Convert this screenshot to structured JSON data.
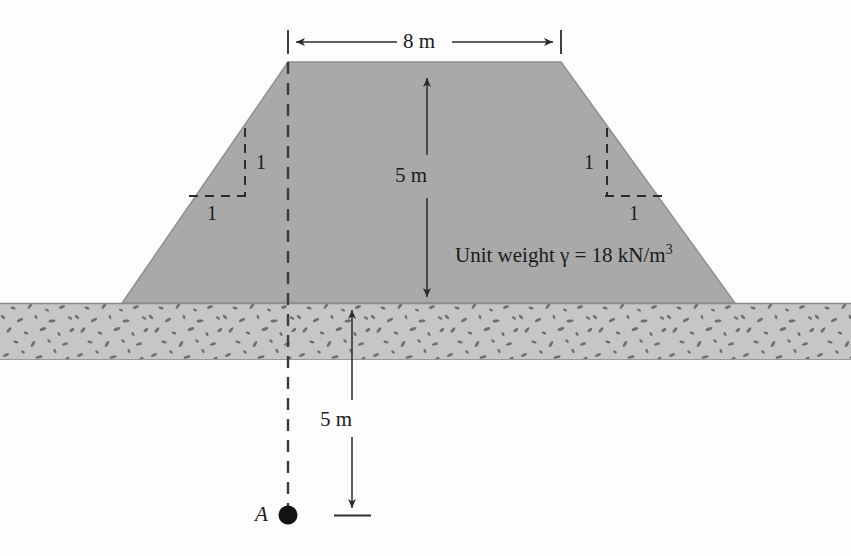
{
  "figure": {
    "type": "engineering-cross-section"
  },
  "labels": {
    "top_width": "8 m",
    "embankment_height": "5 m",
    "depth_below_ground": "5 m",
    "unit_weight": "Unit weight γ = 18 kN/m",
    "unit_weight_exponent": "3",
    "slope_left_vertical": "1",
    "slope_left_horizontal": "1",
    "slope_right_vertical": "1",
    "slope_right_horizontal": "1",
    "point_label": "A"
  },
  "geometry": {
    "embankment": {
      "top_left_x": 288,
      "top_right_x": 561,
      "top_y": 62,
      "base_left_x": 122,
      "base_right_x": 735,
      "base_y": 303,
      "top_width_m": 8,
      "height_m": 5,
      "side_slope": "1:1"
    },
    "ground": {
      "top_y": 303,
      "bottom_y": 360,
      "left_x": 0,
      "right_x": 851
    },
    "point_a": {
      "x": 288,
      "y": 515,
      "depth_m": 5
    }
  },
  "colors": {
    "background": "#fdfdfd",
    "embankment_fill": "#a9a9a9",
    "ground_fill": "#c6c6c6",
    "ground_speckle": "#6e6e6e",
    "line": "#2b2b2b",
    "outline": "#8a8a8a"
  }
}
